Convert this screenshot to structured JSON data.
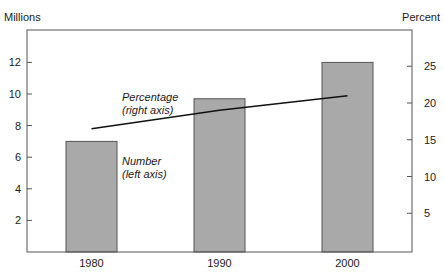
{
  "chart_data": {
    "type": "bar+line",
    "categories": [
      "1980",
      "1990",
      "2000"
    ],
    "series": [
      {
        "name": "Number (left axis)",
        "type": "bar",
        "axis": "left",
        "values": [
          7.0,
          9.7,
          12.0
        ],
        "color": "#a9a9a9"
      },
      {
        "name": "Percentage (right axis)",
        "type": "line",
        "axis": "right",
        "values": [
          16.5,
          19.0,
          21.0
        ],
        "color": "#111111"
      }
    ],
    "title": "",
    "xlabel": "",
    "ylabel_left": "Millions",
    "ylabel_right": "Percent",
    "ylim_left": [
      0,
      14
    ],
    "ylim_right": [
      0,
      30
    ],
    "yticks_left": [
      2,
      4,
      6,
      8,
      10,
      12
    ],
    "yticks_right": [
      5,
      10,
      15,
      20,
      25
    ],
    "grid": false,
    "legend": "none",
    "annotations": [
      {
        "text_line1": "Percentage",
        "text_line2": "(right axis)",
        "target": "line"
      },
      {
        "text_line1": "Number",
        "text_line2": "(left axis)",
        "target": "bars"
      }
    ]
  },
  "labels": {
    "left_axis_title": "Millions",
    "right_axis_title": "Percent",
    "line_annotation_1": "Percentage",
    "line_annotation_2": "(right axis)",
    "bar_annotation_1": "Number",
    "bar_annotation_2": "(left axis)"
  }
}
